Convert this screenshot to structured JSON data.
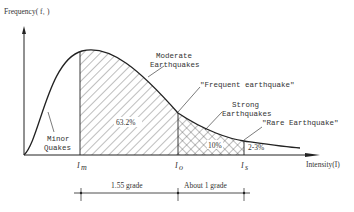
{
  "diagram": {
    "y_axis_label": "Frequency( f₁ )",
    "x_axis_label": "Intensity(I)",
    "x_marks": [
      {
        "label": "I",
        "sub": "m"
      },
      {
        "label": "I",
        "sub": "o"
      },
      {
        "label": "I",
        "sub": "s"
      }
    ],
    "regions": {
      "minor": "Minor\nQuakes",
      "minor_line1": "Minor",
      "minor_line2": "Quakes",
      "moderate_line1": "Moderate",
      "moderate_line2": "Earthquakes",
      "moderate_pct": "63.2%",
      "strong_line1": "Strong",
      "strong_line2": "Earthquakes",
      "strong_pct": "10%",
      "rare_pct": "2-3%"
    },
    "annotations": {
      "frequent": "\"Frequent earthquake\"",
      "rare": "\"Rare Earthquake\""
    },
    "dimensions": {
      "first": "1.55 grade",
      "second": "About 1 grade"
    },
    "colors": {
      "line": "#222222",
      "text": "#333333",
      "background": "#ffffff"
    }
  }
}
